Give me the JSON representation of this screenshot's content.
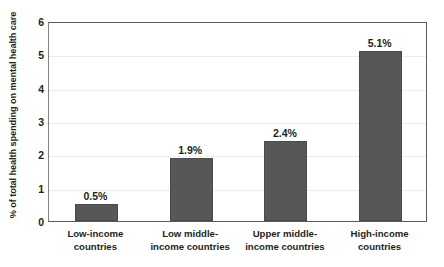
{
  "chart_data": {
    "type": "bar",
    "title": "",
    "xlabel": "",
    "ylabel": "% of total health spending on mental health care",
    "ylim": [
      0,
      6
    ],
    "yticks": [
      0,
      1,
      2,
      3,
      4,
      5,
      6
    ],
    "ytick_labels": [
      "0",
      "1",
      "2",
      "3",
      "4",
      "5",
      "6"
    ],
    "grid": true,
    "legend": null,
    "bar_color": "#575757",
    "categories": [
      "Low-income\ncountries",
      "Low middle-\nincome countries",
      "Upper middle-\nincome countries",
      "High-income\ncountries"
    ],
    "values": [
      0.5,
      1.9,
      2.4,
      5.1
    ],
    "data_labels": [
      "0.5%",
      "1.9%",
      "2.4%",
      "5.1%"
    ]
  }
}
